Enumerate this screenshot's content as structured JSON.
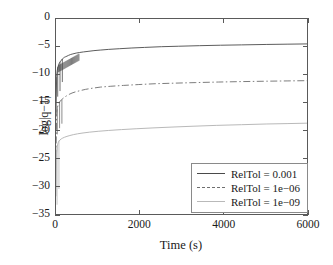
{
  "chart_data": {
    "type": "line",
    "title": "",
    "xlabel": "Time (s)",
    "ylabel": "log|q−1|",
    "xlim": [
      0,
      6000
    ],
    "ylim": [
      -35,
      0
    ],
    "xticks": [
      0,
      2000,
      4000,
      6000
    ],
    "yticks": [
      0,
      -5,
      -10,
      -15,
      -20,
      -25,
      -30,
      -35
    ],
    "xtick_labels": [
      "0",
      "2000",
      "4000",
      "6000"
    ],
    "ytick_labels": [
      "0",
      "−5",
      "−10",
      "−15",
      "−20",
      "−25",
      "−30",
      "−35"
    ],
    "grid": false,
    "legend_position": "lower right",
    "series": [
      {
        "name": "RelTol = 0.001",
        "color": "#4a4a4a",
        "linestyle": "solid",
        "x": [
          0,
          15,
          30,
          45,
          60,
          75,
          90,
          110,
          130,
          150,
          175,
          200,
          230,
          260,
          300,
          350,
          400,
          480,
          560,
          650,
          760,
          900,
          1050,
          1250,
          1500,
          1800,
          2100,
          2500,
          2900,
          3400,
          3900,
          4400,
          5000,
          5500,
          6000
        ],
        "y": [
          -16.5,
          -10.2,
          -9.1,
          -8.6,
          -8.2,
          -7.9,
          -7.7,
          -7.5,
          -7.3,
          -7.1,
          -6.95,
          -6.8,
          -6.7,
          -6.6,
          -6.45,
          -6.3,
          -6.2,
          -6.05,
          -5.95,
          -5.85,
          -5.75,
          -5.62,
          -5.52,
          -5.4,
          -5.28,
          -5.15,
          -5.05,
          -4.92,
          -4.84,
          -4.74,
          -4.66,
          -4.6,
          -4.52,
          -4.47,
          -4.42
        ]
      },
      {
        "name": "RelTol = 1e−06",
        "color": "#6e6e6e",
        "linestyle": "dashdot",
        "x": [
          0,
          15,
          30,
          45,
          60,
          80,
          100,
          130,
          160,
          200,
          250,
          310,
          380,
          460,
          560,
          700,
          860,
          1050,
          1300,
          1600,
          1950,
          2350,
          2800,
          3300,
          3850,
          4400,
          5000,
          5500,
          6000
        ],
        "y": [
          -24.5,
          -16.8,
          -15.8,
          -15.4,
          -15.1,
          -14.8,
          -14.6,
          -14.35,
          -14.15,
          -13.9,
          -13.65,
          -13.4,
          -13.15,
          -12.95,
          -12.75,
          -12.5,
          -12.3,
          -12.1,
          -11.95,
          -11.8,
          -11.65,
          -11.5,
          -11.4,
          -11.3,
          -11.2,
          -11.12,
          -11.05,
          -11.0,
          -10.95
        ]
      },
      {
        "name": "RelTol = 1e−09",
        "color": "#b9b9b9",
        "linestyle": "solid",
        "x": [
          0,
          15,
          30,
          50,
          70,
          95,
          125,
          160,
          205,
          260,
          330,
          410,
          510,
          640,
          800,
          1000,
          1250,
          1550,
          1900,
          2300,
          2750,
          3250,
          3800,
          4400,
          5000,
          5500,
          6000
        ],
        "y": [
          -31.5,
          -24.0,
          -22.6,
          -22.0,
          -21.7,
          -21.5,
          -21.3,
          -21.15,
          -21.0,
          -20.85,
          -20.7,
          -20.55,
          -20.4,
          -20.25,
          -20.1,
          -19.95,
          -19.8,
          -19.65,
          -19.5,
          -19.35,
          -19.2,
          -19.05,
          -18.9,
          -18.78,
          -18.65,
          -18.58,
          -18.5
        ]
      }
    ],
    "spikes": [
      {
        "series": 0,
        "x": 40,
        "ymin": -13.8,
        "ymax": -8.5
      },
      {
        "series": 0,
        "x": 95,
        "ymin": -12.8,
        "ymax": -7.6
      },
      {
        "series": 0,
        "x": 150,
        "ymin": -11.2,
        "ymax": -7.1
      },
      {
        "series": 1,
        "x": 30,
        "ymin": -20.5,
        "ymax": -15.6
      },
      {
        "series": 1,
        "x": 85,
        "ymin": -19.4,
        "ymax": -14.7
      },
      {
        "series": 1,
        "x": 140,
        "ymin": -18.6,
        "ymax": -14.3
      },
      {
        "series": 2,
        "x": 25,
        "ymin": -33.0,
        "ymax": -22.4
      },
      {
        "series": 2,
        "x": 70,
        "ymin": -30.2,
        "ymax": -21.6
      }
    ]
  },
  "legend": {
    "entries": [
      {
        "label": "RelTol = 0.001"
      },
      {
        "label": "RelTol = 1e−06"
      },
      {
        "label": "RelTol = 1e−09"
      }
    ]
  },
  "colors": {
    "axis": "#5a5a5a",
    "series1": "#4a4a4a",
    "series2": "#6e6e6e",
    "series3": "#b9b9b9",
    "background": "#ffffff",
    "text": "#1a1a1a"
  }
}
